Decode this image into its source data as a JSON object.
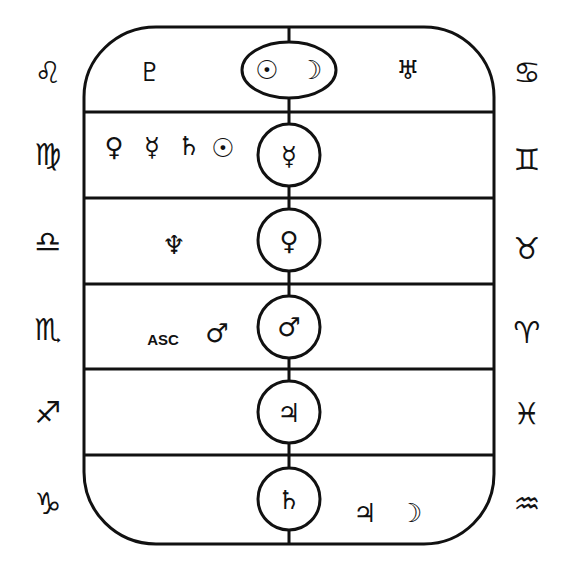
{
  "diagram": {
    "colors": {
      "stroke": "#111111",
      "background": "#ffffff"
    },
    "rows": [
      {
        "index": 0,
        "left_sign": {
          "name": "Leo",
          "glyph": "♌"
        },
        "right_sign": {
          "name": "Cancer",
          "glyph": "♋"
        },
        "center": {
          "shape": "ellipse",
          "planets": [
            {
              "name": "Sun",
              "glyph": "☉"
            },
            {
              "name": "Moon",
              "glyph": "☽"
            }
          ]
        },
        "left_planets": [
          {
            "name": "Pluto",
            "glyph": "♇"
          }
        ],
        "right_planets": [
          {
            "name": "Uranus",
            "glyph": "♅"
          }
        ]
      },
      {
        "index": 1,
        "left_sign": {
          "name": "Virgo",
          "glyph": "♍"
        },
        "right_sign": {
          "name": "Gemini",
          "glyph": "♊"
        },
        "center": {
          "shape": "circle",
          "planets": [
            {
              "name": "Mercury",
              "glyph": "☿"
            }
          ]
        },
        "left_planets": [
          {
            "name": "Venus",
            "glyph": "♀"
          },
          {
            "name": "Mercury",
            "glyph": "☿"
          },
          {
            "name": "Saturn",
            "glyph": "♄"
          },
          {
            "name": "Sun",
            "glyph": "☉"
          }
        ],
        "right_planets": []
      },
      {
        "index": 2,
        "left_sign": {
          "name": "Libra",
          "glyph": "♎"
        },
        "right_sign": {
          "name": "Taurus",
          "glyph": "♉"
        },
        "center": {
          "shape": "circle",
          "planets": [
            {
              "name": "Venus",
              "glyph": "♀"
            }
          ]
        },
        "left_planets": [
          {
            "name": "Neptune",
            "glyph": "♆"
          }
        ],
        "right_planets": []
      },
      {
        "index": 3,
        "left_sign": {
          "name": "Scorpio",
          "glyph": "♏"
        },
        "right_sign": {
          "name": "Aries",
          "glyph": "♈"
        },
        "center": {
          "shape": "circle",
          "planets": [
            {
              "name": "Mars",
              "glyph": "♂"
            }
          ]
        },
        "left_planets": [
          {
            "name": "Ascendant",
            "glyph": "ASC"
          },
          {
            "name": "Mars",
            "glyph": "♂"
          }
        ],
        "right_planets": []
      },
      {
        "index": 4,
        "left_sign": {
          "name": "Sagittarius",
          "glyph": "♐"
        },
        "right_sign": {
          "name": "Pisces",
          "glyph": "♓"
        },
        "center": {
          "shape": "circle",
          "planets": [
            {
              "name": "Jupiter",
              "glyph": "♃"
            }
          ]
        },
        "left_planets": [],
        "right_planets": []
      },
      {
        "index": 5,
        "left_sign": {
          "name": "Capricorn",
          "glyph": "♑"
        },
        "right_sign": {
          "name": "Aquarius",
          "glyph": "♒"
        },
        "center": {
          "shape": "circle",
          "planets": [
            {
              "name": "Saturn",
              "glyph": "♄"
            }
          ]
        },
        "left_planets": [],
        "right_planets": [
          {
            "name": "Jupiter",
            "glyph": "♃"
          },
          {
            "name": "Moon",
            "glyph": "☽"
          }
        ]
      }
    ]
  }
}
